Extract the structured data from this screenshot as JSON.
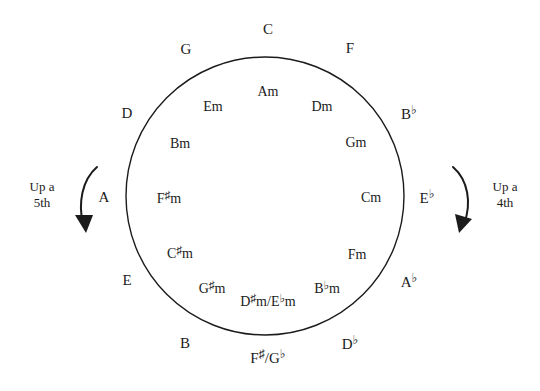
{
  "diagram": {
    "circle": {
      "center_x": 265,
      "center_y": 196,
      "radius": 139,
      "stroke_color": "#1b1b1b",
      "stroke_width": 1.4,
      "fill": "none"
    },
    "background_color": "#ffffff",
    "text_color": "#1b1b1b"
  },
  "outer_keys": [
    {
      "label": "C",
      "base": "C",
      "accidental": "",
      "x": 268,
      "y": 29,
      "angle_deg": 0
    },
    {
      "label": "G",
      "base": "G",
      "accidental": "",
      "x": 186,
      "y": 49,
      "angle_deg": 30
    },
    {
      "label": "D",
      "base": "D",
      "accidental": "",
      "x": 127,
      "y": 113,
      "angle_deg": 60
    },
    {
      "label": "A",
      "base": "A",
      "accidental": "",
      "x": 104,
      "y": 197,
      "angle_deg": 90
    },
    {
      "label": "E",
      "base": "E",
      "accidental": "",
      "x": 127,
      "y": 280,
      "angle_deg": 120
    },
    {
      "label": "B",
      "base": "B",
      "accidental": "",
      "x": 185,
      "y": 343,
      "angle_deg": 150
    },
    {
      "label": "F♯/G♭",
      "base": "F",
      "accidental": "♯",
      "x": 268,
      "y": 357,
      "angle_deg": 180
    },
    {
      "label": "D♭",
      "base": "D",
      "accidental": "♭",
      "x": 350,
      "y": 343,
      "angle_deg": 210
    },
    {
      "label": "A♭",
      "base": "A",
      "accidental": "♭",
      "x": 409,
      "y": 281,
      "angle_deg": 240
    },
    {
      "label": "E♭",
      "base": "E",
      "accidental": "♭",
      "x": 427,
      "y": 197,
      "angle_deg": 270
    },
    {
      "label": "B♭",
      "base": "B",
      "accidental": "♭",
      "x": 409,
      "y": 113,
      "angle_deg": 300
    },
    {
      "label": "F",
      "base": "F",
      "accidental": "",
      "x": 350,
      "y": 48,
      "angle_deg": 330
    }
  ],
  "inner_keys": [
    {
      "label": "Am",
      "x": 268,
      "y": 92,
      "angle_deg": 0
    },
    {
      "label": "Em",
      "x": 213,
      "y": 107,
      "angle_deg": 30
    },
    {
      "label": "Bm",
      "x": 180,
      "y": 144,
      "angle_deg": 60
    },
    {
      "label": "F♯m",
      "x": 169,
      "y": 198,
      "angle_deg": 90
    },
    {
      "label": "C♯m",
      "x": 180,
      "y": 253,
      "angle_deg": 120
    },
    {
      "label": "G♯m",
      "x": 212,
      "y": 288,
      "angle_deg": 150
    },
    {
      "label": "D♯m/E♭m",
      "x": 268,
      "y": 301,
      "angle_deg": 180
    },
    {
      "label": "B♭m",
      "x": 327,
      "y": 288,
      "angle_deg": 210
    },
    {
      "label": "Fm",
      "x": 357,
      "y": 255,
      "angle_deg": 240
    },
    {
      "label": "Cm",
      "x": 371,
      "y": 198,
      "angle_deg": 270
    },
    {
      "label": "Gm",
      "x": 356,
      "y": 143,
      "angle_deg": 300
    },
    {
      "label": "Dm",
      "x": 322,
      "y": 107,
      "angle_deg": 330
    }
  ],
  "directions": [
    {
      "side": "left",
      "line1": "Up a",
      "line2": "5th",
      "text_x": 42,
      "text_y": 195,
      "arrow_path": "M 97 167 C 82 180, 78 203, 83 224",
      "arrow_head": "86,233 75,215 93,215"
    },
    {
      "side": "right",
      "line1": "Up a",
      "line2": "4th",
      "text_x": 505,
      "text_y": 195,
      "arrow_path": "M 453 167 C 468 180, 472 203, 464 224",
      "arrow_head": "459,233 455,214 472,219"
    }
  ]
}
